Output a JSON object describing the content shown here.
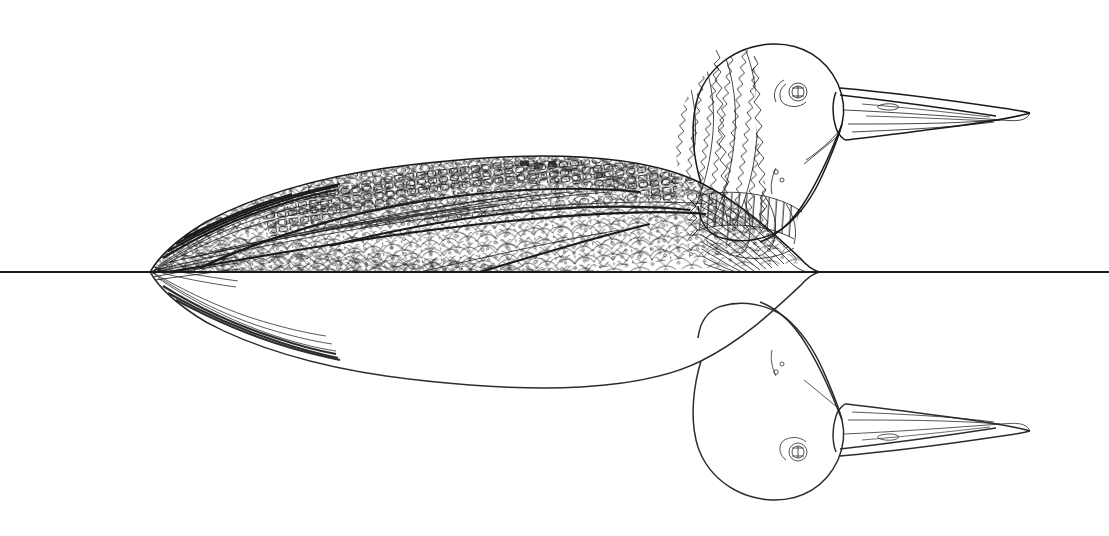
{
  "artwork": {
    "title": "Loon on water with reflection",
    "subject": "loon",
    "style": "black and white line drawing",
    "medium": "pen and ink line art / coloring page",
    "background_color": "#ffffff",
    "ink_color": "#1a1a1a",
    "canvas": {
      "width": 1109,
      "height": 536
    },
    "orientation": "bird facing right"
  },
  "scene": {
    "waterline": {
      "label": "water surface line",
      "y": 272,
      "x_start": 0,
      "x_end": 1109
    },
    "reflection": {
      "label": "mirrored reflection below waterline",
      "axis_y": 272,
      "present": true
    }
  },
  "bird": {
    "head": {
      "label": "head",
      "top_y": 42,
      "pattern": "jagged zigzag feather bands"
    },
    "eye": {
      "label": "eye",
      "cx": 798,
      "cy": 92,
      "r": 9
    },
    "bill": {
      "label": "bill",
      "tip_x": 1030,
      "tip_y": 112,
      "base_x": 842,
      "style": "long straight dagger bill with gonys lines"
    },
    "neck": {
      "label": "neck collar",
      "pattern": "vertical stripe band",
      "stripe_count": 26
    },
    "back": {
      "label": "back and mantle",
      "pattern": "checkerboard scapular squares and scalloped scales",
      "peak_y": 158
    },
    "breast": {
      "label": "breast",
      "pattern": "concentric curved contour lines"
    },
    "tail": {
      "label": "tail",
      "tip_x": 150,
      "pattern": "long tapered feather strokes"
    },
    "flank": {
      "label": "flank",
      "pattern": "overlapping scalloped feather scales with spots"
    }
  },
  "palette": {
    "ink": "#1a1a1a",
    "paper": "#ffffff",
    "mid_gray": "#555555"
  }
}
